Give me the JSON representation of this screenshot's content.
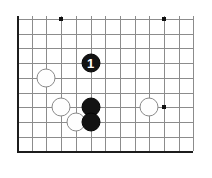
{
  "diagram": {
    "type": "go-board",
    "background_color": "#ffffff",
    "line_color": "#8c8c8c",
    "border_color": "#1c1c1c",
    "black_stone_color": "#131313",
    "white_stone_color": "#fefefe",
    "white_stone_outline": "#8a8a8a",
    "star_point_color": "#101010"
  },
  "board": {
    "columns": 13,
    "rows": 10,
    "origin_x": 17,
    "origin_y": 19,
    "spacing_x": 14.7,
    "spacing_y": 14.7,
    "stone_diameter": 19,
    "star_point_size": 4,
    "strong_edges": [
      "left",
      "bottom"
    ]
  },
  "star_points": [
    {
      "name": "star-point-top-left",
      "col": 3,
      "row": 0
    },
    {
      "name": "star-point-top-right",
      "col": 10,
      "row": 0
    },
    {
      "name": "star-point-right-center",
      "col": 10,
      "row": 6
    }
  ],
  "stones": [
    {
      "name": "black-stone-move-1",
      "color": "black",
      "col": 5,
      "row": 3,
      "label": "1"
    },
    {
      "name": "white-stone-left-upper",
      "color": "white",
      "col": 2,
      "row": 4,
      "label": ""
    },
    {
      "name": "white-stone-left-lower",
      "color": "white",
      "col": 3,
      "row": 6,
      "label": ""
    },
    {
      "name": "white-stone-bottom-center",
      "color": "white",
      "col": 4,
      "row": 7,
      "label": ""
    },
    {
      "name": "black-stone-center-upper",
      "color": "black",
      "col": 5,
      "row": 6,
      "label": ""
    },
    {
      "name": "black-stone-center-lower",
      "color": "black",
      "col": 5,
      "row": 7,
      "label": ""
    },
    {
      "name": "white-stone-right",
      "color": "white",
      "col": 9,
      "row": 6,
      "label": ""
    }
  ]
}
